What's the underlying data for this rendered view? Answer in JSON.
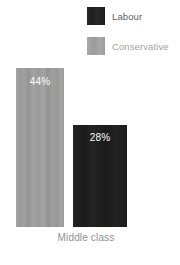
{
  "chart_data": {
    "type": "bar",
    "title": "",
    "subtitle": "",
    "xlabel": "",
    "ylabel": "",
    "categories": [
      "Middle class"
    ],
    "series": [
      {
        "name": "Labour",
        "values": [
          28
        ],
        "value_labels": [
          "28%"
        ],
        "color": "#1f1f1f"
      },
      {
        "name": "Conservative",
        "values": [
          44
        ],
        "value_labels": [
          "44%"
        ],
        "color": "#9b9b9b"
      }
    ],
    "bar_order": [
      "Conservative",
      "Labour"
    ],
    "unit": "%",
    "ylim": [
      0,
      44
    ],
    "grid": false,
    "axis_visible": false,
    "legend_position": "top-right",
    "annotations": []
  },
  "legend": {
    "items": [
      {
        "label": "Labour",
        "swatch_color": "#1e1e1e",
        "text_color": "#5d5d5d"
      },
      {
        "label": "Conservative",
        "swatch_color": "#a0a0a0",
        "text_color": "#a3a3a3"
      }
    ]
  },
  "bars": [
    {
      "series": "Conservative",
      "value_label": "44%",
      "category": "Middle class"
    },
    {
      "series": "Labour",
      "value_label": "28%",
      "category": "Middle class"
    }
  ],
  "axis": {
    "category_label": "Middle class",
    "category_label_color": "#8f8f8f"
  },
  "background": "#ffffff"
}
